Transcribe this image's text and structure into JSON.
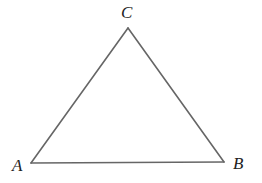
{
  "diagram": {
    "type": "triangle",
    "stroke_color": "#666666",
    "vertices": [
      {
        "label": "A",
        "x": 31,
        "y": 163
      },
      {
        "label": "B",
        "x": 224,
        "y": 162
      },
      {
        "label": "C",
        "x": 128,
        "y": 28
      }
    ],
    "edges": [
      {
        "from": "A",
        "to": "B"
      },
      {
        "from": "B",
        "to": "C"
      },
      {
        "from": "C",
        "to": "A"
      }
    ]
  }
}
